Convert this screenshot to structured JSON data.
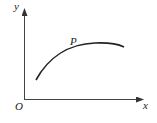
{
  "diagram": {
    "type": "curve-on-axes",
    "axes": {
      "x_label": "x",
      "y_label": "y",
      "origin_label": "O"
    },
    "curve": {
      "description": "concave-down increasing curve reaching a maximum then slightly decreasing",
      "point_label": "P"
    },
    "colors": {
      "line": "#222222",
      "background": "#ffffff"
    }
  }
}
